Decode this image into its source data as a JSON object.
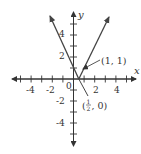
{
  "chart_data": {
    "type": "line",
    "title": "",
    "function": "y = |2x - 1|",
    "xlabel": "x",
    "ylabel": "y",
    "xlim": [
      -5.5,
      6
    ],
    "ylim": [
      -6,
      6
    ],
    "grid": false,
    "x_tick_labels": [
      "-4",
      "-2",
      "2",
      "4"
    ],
    "y_tick_labels": [
      "4",
      "2",
      "-2",
      "-4"
    ],
    "origin_label": "0",
    "series": [
      {
        "name": "y = |2x - 1|",
        "points": [
          [
            -2.35,
            5.7
          ],
          [
            0.5,
            0
          ],
          [
            3.3,
            5.6
          ]
        ]
      }
    ],
    "annotations": [
      {
        "label": "(1, 1)",
        "point": [
          1,
          1
        ]
      },
      {
        "label_num": "1",
        "label_den": "2",
        "label_prefix": "(",
        "label_suffix": ", 0)",
        "label": "(1/2, 0)",
        "point": [
          0.5,
          0
        ]
      }
    ]
  },
  "colors": {
    "line": "#444444",
    "axis": "#333333"
  }
}
